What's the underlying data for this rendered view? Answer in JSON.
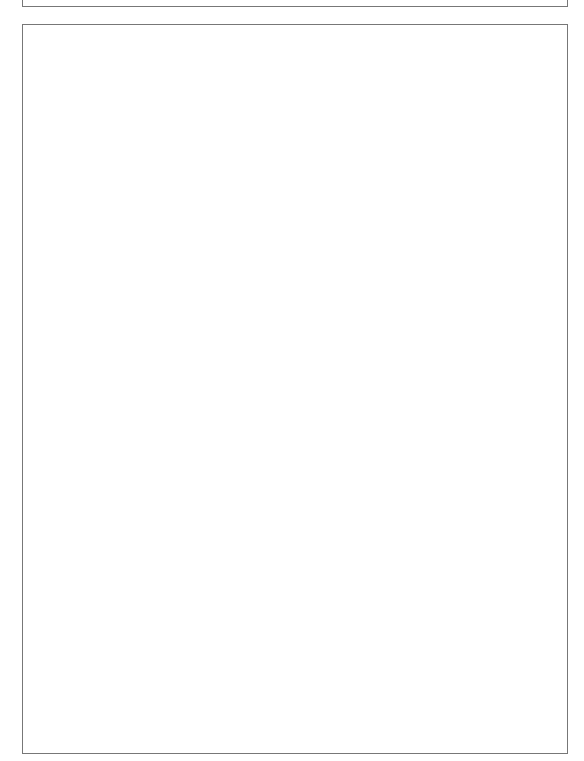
{
  "document": {
    "title": "House of Quality — Supermarket",
    "orientation": "rotated 90 degrees clockwise"
  },
  "headers": {
    "importance": "IMPORTANCE",
    "competitive_evaluation": [
      "COMPETITIVE",
      "EVALUATION"
    ],
    "selling_points": [
      "SELLING",
      "POINTS"
    ],
    "scale": [
      "1",
      "2",
      "3",
      "4",
      "5"
    ]
  },
  "categories": [
    {
      "name": "SERVICE",
      "groups": [
        {
          "name": "COURTESY",
          "items": [
            "FRIENDLINESS",
            "SPEED OF CHECKOUT"
          ]
        },
        {
          "name": "EFFICIENCY",
          "items": [
            "CLEAN STORE",
            "SHELVES WELL STOCKED",
            "PRODUCT CUSTOMER WANTS",
            "EASY SHOPPING",
            "ACCURATE CHECKOUT",
            "ADVERTISED SPECIALS"
          ]
        }
      ]
    },
    {
      "name": "ECONOMIC",
      "groups": [
        {
          "name": "ADDED VALUE",
          "items": [
            "STORE COUPONING"
          ],
          "subgroup": {
            "name": "PRODUCT QUALITY",
            "items": [
              "GROCERY",
              "PRODUCE",
              "MEAT",
              "DELI",
              "DRUG/GM",
              "PHARMACY"
            ]
          }
        },
        {
          "name": "PRICING",
          "items": [
            "EVERYDAY LOW PRICES",
            "STORE BRAND"
          ]
        }
      ]
    }
  ],
  "bottom_rows": [
    "COMPETITIVE EVALUATION",
    "TARGETS",
    "DEPLOYMENT"
  ],
  "customer_requirements": [
    "FRIENDLINESS",
    "SPEED OF CHECKOUT",
    "CLEAN STORE",
    "SHELVES WELL STOCKED",
    "PRODUCT CUSTOMER WANTS",
    "EASY SHOPPING",
    "ACCURATE CHECKOUT",
    "ADVERTISED SPECIALS",
    "STORE COUPONING",
    "GROCERY",
    "PRODUCE",
    "MEAT",
    "DELI",
    "DRUG/GM",
    "PHARMACY",
    "EVERYDAY LOW PRICES",
    "STORE BRAND"
  ],
  "technical_requirements": [
    "STORE",
    "ADVERTISING DEPARTMENT",
    "STORE DESIGN & LAYOUT",
    "PERISHABLE QUALITY ASSURANCE",
    "DATA/SCANNING INPUT",
    "STORE OPERATION SERVICES",
    "TRAINING & DEVELOPMENT",
    "PRODUCT BUYERS",
    "STORE SCHEDULING",
    "PRICING ANALYSIS",
    "MERCHANDISING DEPARTMENT"
  ],
  "importance": [
    1,
    1,
    2,
    4,
    4,
    2,
    1,
    1,
    1,
    2,
    3,
    3,
    2,
    2,
    2,
    4,
    3
  ],
  "competitive_evaluation": [
    2,
    1,
    2,
    2,
    2,
    1,
    1,
    1,
    1,
    2,
    1,
    1,
    2,
    2,
    2,
    4,
    2
  ],
  "selling_points": [
    false,
    false,
    false,
    true,
    true,
    false,
    false,
    false,
    false,
    false,
    true,
    true,
    false,
    false,
    false,
    false,
    false
  ],
  "legend_symbols": {
    "strong": "circle-with-dot",
    "medium": "open-circle",
    "weak": "triangle"
  },
  "matrix": {
    "note": "rows = technical requirements (top to bottom), cols = customer requirements index; S=strong(dot circle), M=medium(circle), T=filled triangle, t=open triangle",
    "cells": [
      [
        "S",
        "M",
        "S",
        "S",
        "T",
        "M",
        "M",
        "M",
        "T",
        "",
        "",
        "",
        "",
        "",
        "",
        "T",
        ""
      ],
      [
        "",
        "",
        "",
        "",
        "",
        "",
        "M",
        "S",
        "S",
        "",
        "",
        "",
        "",
        "",
        "",
        "S",
        "M"
      ],
      [
        "",
        "",
        "M",
        "M",
        "",
        "S",
        "",
        "",
        "",
        "",
        "",
        "",
        "",
        "",
        "",
        "",
        ""
      ],
      [
        "",
        "",
        "",
        "",
        "",
        "",
        "",
        "",
        "",
        "S",
        "S",
        "S",
        "S",
        "",
        "",
        "",
        ""
      ],
      [
        "",
        "",
        "",
        "",
        "T",
        "",
        "S",
        "M",
        "",
        "",
        "",
        "",
        "",
        "",
        "",
        "",
        ""
      ],
      [
        "",
        "M",
        "M",
        "",
        "",
        "S",
        "",
        "",
        "",
        "",
        "",
        "",
        "",
        "",
        "",
        "",
        ""
      ],
      [
        "S",
        "S",
        "S",
        "S",
        "",
        "M",
        "S",
        "",
        "",
        "",
        "",
        "",
        "",
        "",
        "",
        "",
        ""
      ],
      [
        "",
        "",
        "",
        "S",
        "S",
        "",
        "",
        "S",
        "S",
        "S",
        "M",
        "S",
        "S",
        "S",
        "M",
        "T",
        "S",
        "S"
      ],
      [
        "t",
        "S",
        "M",
        "M",
        "",
        "",
        "",
        "",
        "",
        "",
        "",
        "",
        "",
        "",
        "",
        "",
        ""
      ],
      [
        "",
        "",
        "",
        "",
        "",
        "",
        "S",
        "M",
        "M",
        "",
        "",
        "",
        "",
        "",
        "",
        "S",
        "M"
      ],
      [
        "",
        "",
        "",
        "",
        "S",
        "",
        "",
        "S",
        "S",
        "",
        "",
        "",
        "",
        "",
        "",
        "M",
        "S"
      ]
    ]
  },
  "roof_correlations": [
    {
      "pos": [
        1,
        1
      ],
      "type": "S"
    },
    {
      "pos": [
        2,
        1
      ],
      "type": "M"
    },
    {
      "pos": [
        3,
        3
      ],
      "type": "S"
    },
    {
      "pos": [
        4,
        4
      ],
      "type": "M"
    },
    {
      "pos": [
        5,
        2
      ],
      "type": "M"
    },
    {
      "pos": [
        6,
        1
      ],
      "type": "M"
    },
    {
      "pos": [
        6,
        4
      ],
      "type": "S"
    },
    {
      "pos": [
        6,
        7
      ],
      "type": "M"
    },
    {
      "pos": [
        7,
        7
      ],
      "type": "M"
    },
    {
      "pos": [
        7,
        1
      ],
      "type": "S"
    },
    {
      "pos": [
        8,
        4
      ],
      "type": "S"
    },
    {
      "pos": [
        8,
        7
      ],
      "type": "S"
    },
    {
      "pos": [
        9,
        7
      ],
      "type": "S"
    },
    {
      "pos": [
        10,
        9
      ],
      "type": "M"
    }
  ]
}
